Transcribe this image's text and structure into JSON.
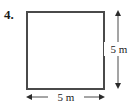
{
  "figure": {
    "item_number": "4.",
    "shape": "square",
    "shape_icon": "square-outline-icon",
    "stroke_color": "#4a4a4a",
    "fill_color": "#ffffff",
    "background_color": "#ffffff",
    "text_color": "#1a1a1a"
  },
  "dimensions": {
    "right": {
      "label": "5 m",
      "value": 5,
      "unit": "m",
      "orientation": "vertical",
      "arrow_icon": "double-headed-arrow-vertical-icon"
    },
    "bottom": {
      "label": "5 m",
      "value": 5,
      "unit": "m",
      "orientation": "horizontal",
      "arrow_icon": "double-headed-arrow-horizontal-icon"
    }
  }
}
